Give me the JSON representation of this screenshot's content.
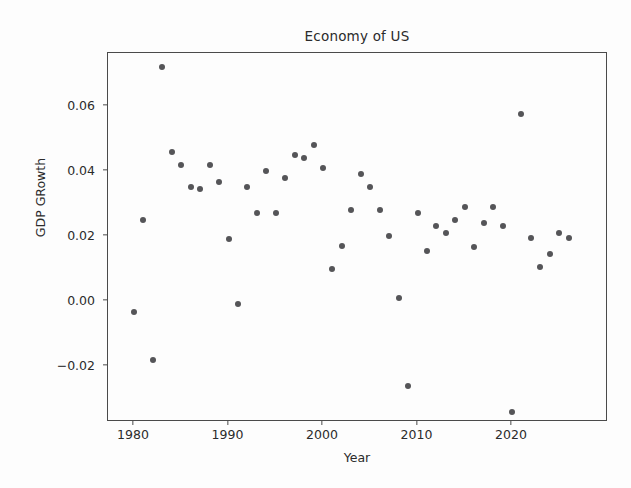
{
  "chart_data": {
    "type": "scatter",
    "title": "Economy of US",
    "xlabel": "Year",
    "ylabel": "GDP GRowth",
    "grid": false,
    "legend": null,
    "xlim": [
      1978.0,
      1978.0
    ],
    "ylim": [
      -0.0395,
      0.0785
    ],
    "xticks": [
      1980,
      1990,
      2000,
      2010,
      2020
    ],
    "xtick_labels": [
      "1980",
      "1990",
      "2000",
      "2010",
      "2020"
    ],
    "yticks": [
      -0.02,
      0.0,
      0.02,
      0.04,
      0.06
    ],
    "ytick_labels": [
      "−0.02",
      "0.00",
      "0.02",
      "0.04",
      "0.06"
    ],
    "marker_color": "#555558",
    "axis_color": "#4a4a4a",
    "x": [
      1980,
      1981,
      1982,
      1983,
      1984,
      1985,
      1986,
      1987,
      1988,
      1989,
      1990,
      1991,
      1992,
      1993,
      1994,
      1995,
      1996,
      1997,
      1998,
      1999,
      2000,
      2001,
      2002,
      2003,
      2004,
      2005,
      2006,
      2007,
      2008,
      2009,
      2010,
      2011,
      2012,
      2013,
      2014,
      2015,
      2016,
      2017,
      2018,
      2019,
      2020,
      2021,
      2022,
      2023,
      2024,
      2025,
      2026
    ],
    "y": [
      -0.0035,
      0.025,
      -0.018,
      0.072,
      0.046,
      0.042,
      0.035,
      0.0345,
      0.042,
      0.0365,
      0.019,
      -0.001,
      0.035,
      0.027,
      0.04,
      0.027,
      0.038,
      0.045,
      0.044,
      0.048,
      0.041,
      0.01,
      0.017,
      0.028,
      0.039,
      0.035,
      0.028,
      0.02,
      0.001,
      -0.026,
      0.027,
      0.0155,
      0.023,
      0.021,
      0.025,
      0.029,
      0.0165,
      0.024,
      0.029,
      0.023,
      -0.034,
      0.0575,
      0.0195,
      0.0105,
      0.0145,
      0.021,
      0.0195
    ]
  },
  "plot": {
    "title": "Economy of US",
    "x_axis_label": "Year",
    "y_axis_label": "GDP GRowth"
  }
}
